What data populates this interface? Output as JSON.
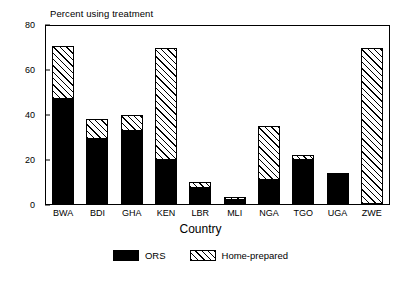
{
  "chart_data": {
    "type": "bar",
    "title": "Percent using treatment",
    "xlabel": "Country",
    "ylabel": "",
    "ylim": [
      0,
      80
    ],
    "yticks": [
      0,
      20,
      40,
      60,
      80
    ],
    "grid": false,
    "stacked": true,
    "legend_position": "bottom-center",
    "categories": [
      "BWA",
      "BDI",
      "GHA",
      "KEN",
      "LBR",
      "MLI",
      "NGA",
      "TGO",
      "UGA",
      "ZWE"
    ],
    "series": [
      {
        "name": "ORS",
        "fill": "solid-black",
        "color": "#000000",
        "values": [
          47,
          29,
          33,
          20,
          7,
          2,
          11,
          20,
          13,
          0
        ]
      },
      {
        "name": "Home-prepared",
        "fill": "diagonal-hatch",
        "color": "#ffffff",
        "values": [
          24,
          9,
          7,
          50,
          3,
          1,
          24,
          2,
          1,
          70
        ]
      }
    ],
    "totals": [
      71,
      38,
      40,
      70,
      10,
      3,
      35,
      22,
      14,
      70
    ]
  },
  "axis": {
    "y_tick_labels": [
      "0",
      "20",
      "40",
      "60",
      "80"
    ],
    "x_tick_labels": [
      "BWA",
      "BDI",
      "GHA",
      "KEN",
      "LBR",
      "MLI",
      "NGA",
      "TGO",
      "UGA",
      "ZWE"
    ],
    "x_title": "Country",
    "chart_title": "Percent using treatment"
  },
  "legend": {
    "items": [
      {
        "label": "ORS",
        "swatch": "solid-black"
      },
      {
        "label": "Home-prepared",
        "swatch": "diagonal-hatch"
      }
    ]
  }
}
